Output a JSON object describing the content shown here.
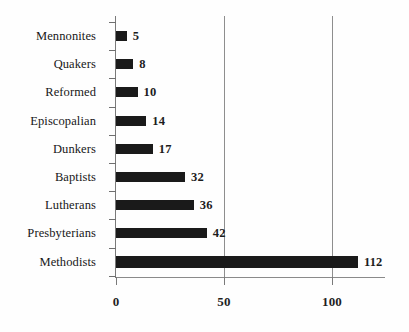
{
  "chart_data": {
    "type": "bar",
    "orientation": "horizontal",
    "title": "",
    "xlabel": "",
    "ylabel": "",
    "xlim": [
      0,
      124
    ],
    "grid": "vertical-gridlines-at-50-and-100",
    "legend": "none",
    "categories": [
      "Mennonites",
      "Quakers",
      "Reformed",
      "Episcopalian",
      "Dunkers",
      "Baptists",
      "Lutherans",
      "Presbyterians",
      "Methodists"
    ],
    "values": [
      5,
      8,
      10,
      14,
      17,
      32,
      36,
      42,
      112
    ],
    "value_labels": [
      "5",
      "8",
      "10",
      "14",
      "17",
      "32",
      "36",
      "42",
      "112"
    ],
    "xticks": [
      0,
      50,
      100
    ],
    "xtick_labels": [
      "0",
      "50",
      "100"
    ],
    "bar_color": "#1a1a1a",
    "gridline_color": "#8e8e8e",
    "axis_color": "#7a7a7a",
    "background_color": "#fefefe"
  },
  "axis": {
    "ticks": [
      {
        "label": "0",
        "value": 0
      },
      {
        "label": "50",
        "value": 50
      },
      {
        "label": "100",
        "value": 100
      }
    ]
  },
  "bars": [
    {
      "label": "Mennonites",
      "value": 5,
      "value_label": "5"
    },
    {
      "label": "Quakers",
      "value": 8,
      "value_label": "8"
    },
    {
      "label": "Reformed",
      "value": 10,
      "value_label": "10"
    },
    {
      "label": "Episcopalian",
      "value": 14,
      "value_label": "14"
    },
    {
      "label": "Dunkers",
      "value": 17,
      "value_label": "17"
    },
    {
      "label": "Baptists",
      "value": 32,
      "value_label": "32"
    },
    {
      "label": "Lutherans",
      "value": 36,
      "value_label": "36"
    },
    {
      "label": "Presbyterians",
      "value": 42,
      "value_label": "42"
    },
    {
      "label": "Methodists",
      "value": 112,
      "value_label": "112"
    }
  ]
}
